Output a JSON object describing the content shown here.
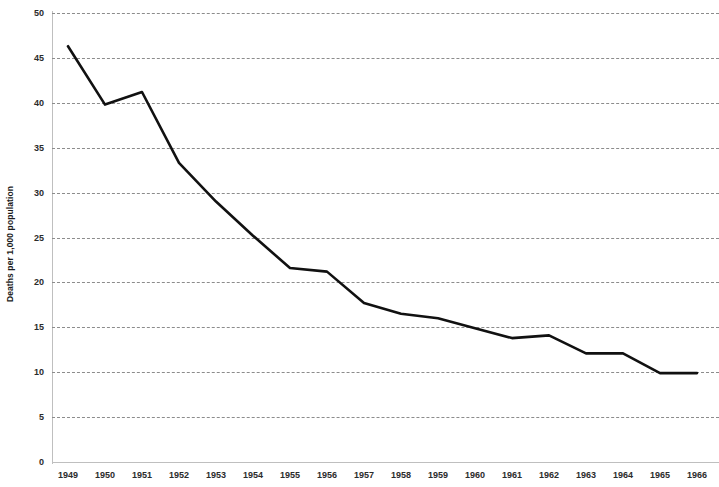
{
  "chart_data": {
    "type": "line",
    "title": "",
    "xlabel": "",
    "ylabel": "Deaths per 1,000 population",
    "xlim": [
      1949,
      1966
    ],
    "ylim": [
      0,
      50
    ],
    "grid": true,
    "legend": "none",
    "y_ticks": [
      0,
      5,
      10,
      15,
      20,
      25,
      30,
      35,
      40,
      45,
      50
    ],
    "y_tick_labels": [
      "0",
      "5",
      "10",
      "15",
      "20",
      "25",
      "30",
      "35",
      "40",
      "45",
      "50"
    ],
    "categories": [
      "1949",
      "1950",
      "1951",
      "1952",
      "1953",
      "1954",
      "1955",
      "1956",
      "1957",
      "1958",
      "1959",
      "1960",
      "1961",
      "1962",
      "1963",
      "1964",
      "1965",
      "1966"
    ],
    "x": [
      1949,
      1950,
      1951,
      1952,
      1953,
      1954,
      1955,
      1956,
      1957,
      1958,
      1959,
      1960,
      1961,
      1962,
      1963,
      1964,
      1965,
      1966
    ],
    "values": [
      46.3,
      39.8,
      41.2,
      33.3,
      29.0,
      25.2,
      21.6,
      21.2,
      17.7,
      16.5,
      16.0,
      14.9,
      13.8,
      14.1,
      12.1,
      12.1,
      9.9,
      9.9
    ],
    "series": [
      {
        "name": "Deaths per 1,000 population",
        "color": "#111111",
        "line_width": 2.6,
        "values": [
          46.3,
          39.8,
          41.2,
          33.3,
          29.0,
          25.2,
          21.6,
          21.2,
          17.7,
          16.5,
          16.0,
          14.9,
          13.8,
          14.1,
          12.1,
          12.1,
          9.9,
          9.9
        ]
      }
    ],
    "colors": {
      "line": "#111111",
      "gridline": "#8c8c8c",
      "axis": "#bfbfbf",
      "text": "#2b2b2b",
      "background": "#ffffff"
    }
  }
}
